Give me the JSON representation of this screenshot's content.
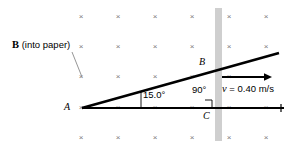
{
  "figure": {
    "background_color": "#ffffff",
    "width": 289,
    "height": 149
  },
  "labels": {
    "b_field_symbol": "B",
    "b_field_note": " (into paper)",
    "point_a": "A",
    "point_b": "B",
    "point_c": "C",
    "angle_at_a": "15.0°",
    "angle_at_c": "90°",
    "velocity_symbol": "v",
    "velocity_value": " = 0.40 m/s"
  },
  "colors": {
    "line": "#000000",
    "field_mark": "#7a7a7a",
    "leader": "#8a8a8a",
    "bar_fill": "#cfcfcf",
    "thin_rule": "#000000"
  },
  "geometry": {
    "pivot_a": {
      "x": 82,
      "y": 108
    },
    "point_b": {
      "x": 214,
      "y": 65
    },
    "point_c": {
      "x": 214,
      "y": 108
    },
    "rod_end": {
      "x": 279,
      "y": 53
    },
    "rail_end": {
      "x": 284,
      "y": 108
    },
    "vertical_bar": {
      "x": 215,
      "y": 8,
      "width": 7,
      "height": 133
    },
    "velocity_arrow": {
      "x1": 222,
      "y1": 77,
      "x2": 272,
      "y2": 77
    },
    "leader_line": {
      "x1": 72,
      "y1": 52,
      "x2": 82,
      "y2": 77
    }
  },
  "field_marks": {
    "glyph": "×",
    "columns": [
      81,
      118,
      155,
      192,
      229,
      266
    ],
    "rows": [
      17,
      47,
      77,
      108,
      138
    ],
    "count": 30
  }
}
